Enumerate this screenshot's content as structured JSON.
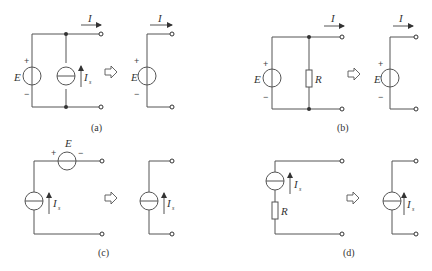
{
  "panels": [
    {
      "id": "a",
      "caption": "(a)",
      "source_label": "E",
      "plus": "+",
      "minus": "−",
      "current_source_label": "I",
      "current_source_sub": "s",
      "output_current": "I",
      "equiv_source_label": "E"
    },
    {
      "id": "b",
      "caption": "(b)",
      "source_label": "E",
      "plus": "+",
      "minus": "−",
      "resistor_label": "R",
      "output_current": "I",
      "equiv_source_label": "E"
    },
    {
      "id": "c",
      "caption": "(c)",
      "source_label": "E",
      "plus": "+",
      "minus": "−",
      "current_source_label": "I",
      "current_source_sub": "s",
      "equiv_current_label": "I",
      "equiv_current_sub": "s"
    },
    {
      "id": "d",
      "caption": "(d)",
      "resistor_label": "R",
      "current_source_label": "I",
      "current_source_sub": "s",
      "equiv_current_label": "I",
      "equiv_current_sub": "s"
    }
  ],
  "equivalence_symbol": "⇨"
}
